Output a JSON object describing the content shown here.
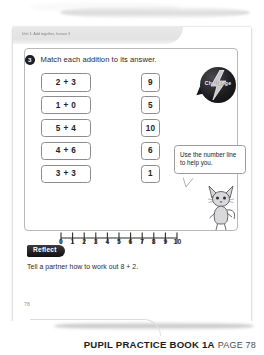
{
  "running_head": "Unit 1: Add together, lesson 3",
  "challenge_badge": {
    "label": "Challenge",
    "icon": "lightning-bolt-icon",
    "color": "#1d1d20"
  },
  "question": {
    "number": "3",
    "prompt": "Match each addition to its answer.",
    "additions": [
      "2 + 3",
      "1 + 0",
      "5 + 4",
      "4 + 6",
      "3 + 3"
    ],
    "answers": [
      "9",
      "5",
      "10",
      "6",
      "1"
    ]
  },
  "hint": {
    "text": "Use the number line to help you.",
    "character": "cat-character-illustration"
  },
  "number_line": {
    "labels": [
      "0",
      "1",
      "2",
      "3",
      "4",
      "5",
      "6",
      "7",
      "8",
      "9",
      "10"
    ],
    "min": 0,
    "max": 10
  },
  "reflect": {
    "badge_label": "Reflect",
    "text": "Tell a partner how to work out 8 + 2.",
    "badge_color": "#202023"
  },
  "page_number": "78",
  "footer": {
    "title": "PUPIL PRACTICE BOOK 1A",
    "page_label": "PAGE 78"
  }
}
